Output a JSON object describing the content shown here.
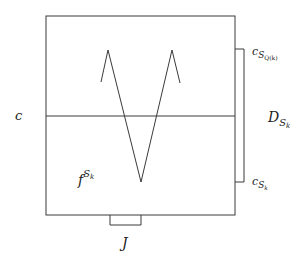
{
  "diagram": {
    "stroke_color": "#3a3a3a",
    "background": "#ffffff",
    "labels": {
      "c_left": {
        "base": "c"
      },
      "c_top_right": {
        "base": "c",
        "sub": "S",
        "subsub": "Q(k)"
      },
      "D_right": {
        "base": "D",
        "sub": "S",
        "subsub": "k"
      },
      "c_bottom_right": {
        "base": "c",
        "sub": "S",
        "subsub": "k"
      },
      "f_inner": {
        "base": "f",
        "sup": "S",
        "supsub": "k"
      },
      "J_bottom": {
        "base": "J"
      }
    }
  }
}
